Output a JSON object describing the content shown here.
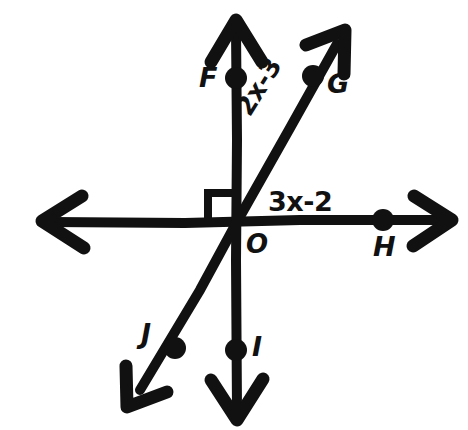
{
  "figure": {
    "background_color": "#ffffff",
    "ink_color": "#111111",
    "stroke_width_px": 9
  },
  "points": {
    "origin": {
      "label": "O",
      "x": 238,
      "y": 220
    },
    "F": {
      "label": "F",
      "x": 236,
      "y": 78
    },
    "G": {
      "label": "G",
      "x": 313,
      "y": 76
    },
    "H": {
      "label": "H",
      "x": 383,
      "y": 220
    },
    "I": {
      "label": "I",
      "x": 236,
      "y": 350
    },
    "J": {
      "label": "J",
      "x": 175,
      "y": 348
    }
  },
  "lines": [
    {
      "name": "vertical-line-FI",
      "from": {
        "x": 236,
        "y": 18
      },
      "to": {
        "x": 237,
        "y": 420
      },
      "arrowheads": "both"
    },
    {
      "name": "horizontal-line",
      "from": {
        "x": 40,
        "y": 222
      },
      "to": {
        "x": 450,
        "y": 220
      },
      "arrowheads": "both"
    },
    {
      "name": "diagonal-line-JG",
      "from": {
        "x": 128,
        "y": 406
      },
      "to": {
        "x": 345,
        "y": 32
      },
      "arrowheads": "both"
    }
  ],
  "angle_markers": [
    {
      "name": "right-angle-upper-left",
      "type": "right-angle-square",
      "quadrant": "upper-left",
      "measure_degrees": 90
    }
  ],
  "expressions": {
    "upper_angle": "2x-3",
    "lower_angle": "3x-2"
  }
}
